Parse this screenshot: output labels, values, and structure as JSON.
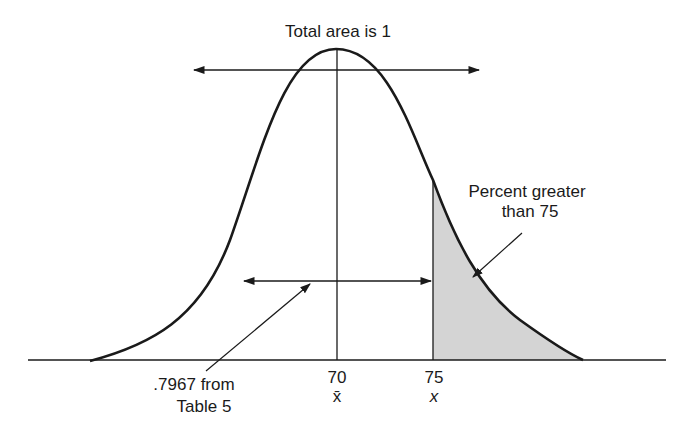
{
  "diagram": {
    "title": "Total area is 1",
    "type": "normal distribution curve",
    "annotations": {
      "right_tail": [
        "Percent greater",
        "than 75"
      ],
      "left_area": [
        ".7967 from",
        "Table 5"
      ]
    },
    "axis_ticks": [
      {
        "value": "70",
        "symbol": "x̄"
      },
      {
        "value": "75",
        "symbol": "x"
      }
    ],
    "colors": {
      "line": "#1a1a1a",
      "shade": "#d4d4d4",
      "background": "#ffffff"
    }
  }
}
